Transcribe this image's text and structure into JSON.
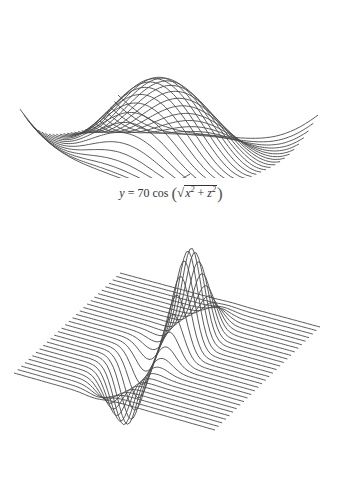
{
  "figure": {
    "line_color": "#4a4a4a",
    "background": "#ffffff",
    "top_plot": {
      "description": "3D wireframe surface rendered as stacked curves",
      "function": "y = 70 cos(sqrt(x^2 + z^2))",
      "amplitude": 70,
      "curve_count": 28
    },
    "caption": {
      "lhs": "y",
      "equals": "=",
      "coefficient": "70",
      "func": "cos",
      "radicand_x": "x",
      "radicand_op": "+",
      "radicand_z": "z",
      "exponent": "2"
    },
    "bottom_plot": {
      "description": "3D wireframe surface with a positive peak and negative trough",
      "curve_count": 30
    }
  }
}
